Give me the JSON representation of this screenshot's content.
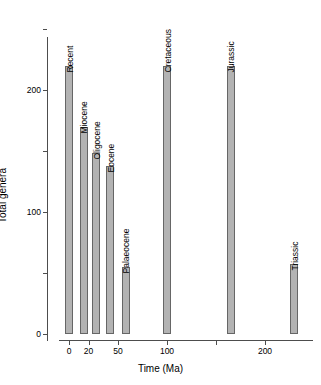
{
  "chart_data": {
    "type": "bar",
    "title": "",
    "xlabel": "Time (Ma)",
    "ylabel": "Total genera",
    "xlim": [
      -10,
      250
    ],
    "ylim": [
      0,
      250
    ],
    "grid": false,
    "legend": "none",
    "x_ticks": [
      {
        "value": 0,
        "label": "0"
      },
      {
        "value": 20,
        "label": "20"
      },
      {
        "value": 50,
        "label": "50"
      },
      {
        "value": 100,
        "label": "100"
      },
      {
        "value": 150,
        "label": ""
      },
      {
        "value": 200,
        "label": "200"
      }
    ],
    "y_ticks": [
      {
        "value": 0,
        "label": "0"
      },
      {
        "value": 50,
        "label": ""
      },
      {
        "value": 100,
        "label": "100"
      },
      {
        "value": 150,
        "label": ""
      },
      {
        "value": 200,
        "label": "200"
      },
      {
        "value": 250,
        "label": ""
      }
    ],
    "bar_color": "#b3b3b3",
    "bar_edge_color": "#666666",
    "categories": [
      "Recent",
      "Miocene",
      "Oligocene",
      "Eocene",
      "Palaeocene",
      "Cretaceous",
      "Jurassic",
      "Triassic"
    ],
    "x": [
      0,
      15,
      28,
      42,
      58,
      100,
      165,
      230
    ],
    "values": [
      220,
      170,
      148,
      138,
      55,
      220,
      220,
      57
    ],
    "bars": [
      {
        "name": "Recent",
        "x": 0,
        "value": 220
      },
      {
        "name": "Miocene",
        "x": 15,
        "value": 170
      },
      {
        "name": "Oligocene",
        "x": 28,
        "value": 148
      },
      {
        "name": "Eocene",
        "x": 42,
        "value": 138
      },
      {
        "name": "Palaeocene",
        "x": 58,
        "value": 55
      },
      {
        "name": "Cretaceous",
        "x": 100,
        "value": 220
      },
      {
        "name": "Jurassic",
        "x": 165,
        "value": 220
      },
      {
        "name": "Triassic",
        "x": 230,
        "value": 57
      }
    ]
  }
}
